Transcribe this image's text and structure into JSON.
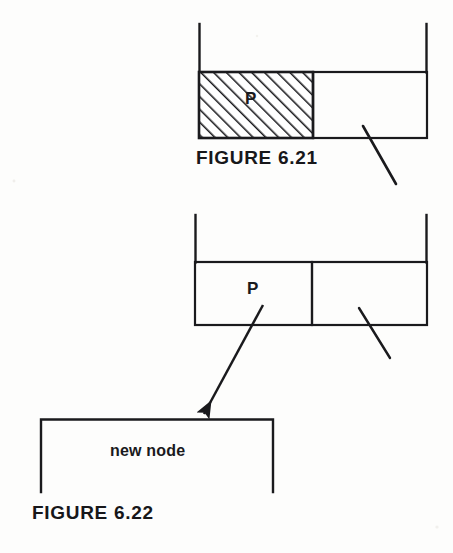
{
  "document": {
    "kind": "scanned-textbook-figure",
    "page_background": "#fdfdfc",
    "ink_color": "#1a1a1d"
  },
  "figures": [
    {
      "id": "figure-6-21",
      "caption": "FIGURE 6.21",
      "description": "Two-field linked list node; the data (left) field is cross-hatched and labelled P, the right pointer field carries a diagonal null slash.",
      "node": {
        "left_field": {
          "label": "P",
          "fill": "diagonal-hatch",
          "hatch_color": "#1a1a1d",
          "hatch_spacing_px": 9,
          "hatch_angle_deg": 45
        },
        "right_field": {
          "label": "",
          "fill": "none",
          "marker": "null-pointer-slash"
        }
      },
      "stubs": [
        "left-incoming-line",
        "right-incoming-line"
      ]
    },
    {
      "id": "figure-6-22",
      "caption": "FIGURE 6.22",
      "description": "Same two-field node, now unshaded; an arrow leaves the P field and points down-left to the top edge of a new node box. The right field keeps its null slash.",
      "node": {
        "left_field": {
          "label": "P",
          "fill": "none"
        },
        "right_field": {
          "label": "",
          "fill": "none",
          "marker": "null-pointer-slash"
        }
      },
      "arrow": {
        "label": "",
        "from": "P field of node",
        "to": "new node box",
        "style": "solid-with-filled-arrowhead"
      },
      "new_node": {
        "label": "new node",
        "shape": "open-bottom-rectangle"
      },
      "stubs": [
        "left-incoming-line",
        "right-incoming-line"
      ]
    }
  ],
  "labels": {
    "p_upper": "P",
    "p_lower": "P",
    "new_node": "new node",
    "caption_621": "FIGURE 6.21",
    "caption_622": "FIGURE 6.22"
  }
}
